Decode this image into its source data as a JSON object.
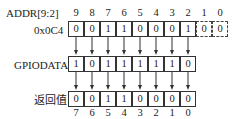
{
  "diagram": {
    "addr_label": "ADDR[9:2]",
    "addr_value_label": "0x0C4",
    "addr_bit_indices": [
      "9",
      "8",
      "7",
      "6",
      "5",
      "4",
      "3",
      "2",
      "1",
      "0"
    ],
    "addr_bits": [
      "0",
      "0",
      "1",
      "1",
      "0",
      "0",
      "0",
      "1",
      "0",
      "0"
    ],
    "addr_dashed_bits": [
      8,
      9
    ],
    "gpiodata_label": "GPIODATA",
    "gpiodata_bits": [
      "1",
      "0",
      "1",
      "1",
      "1",
      "1",
      "1",
      "0"
    ],
    "result_label": "返回值",
    "result_bits": [
      "0",
      "0",
      "1",
      "1",
      "0",
      "0",
      "0",
      "0"
    ],
    "result_bit_indices": [
      "7",
      "6",
      "5",
      "4",
      "3",
      "2",
      "1",
      "0"
    ]
  }
}
